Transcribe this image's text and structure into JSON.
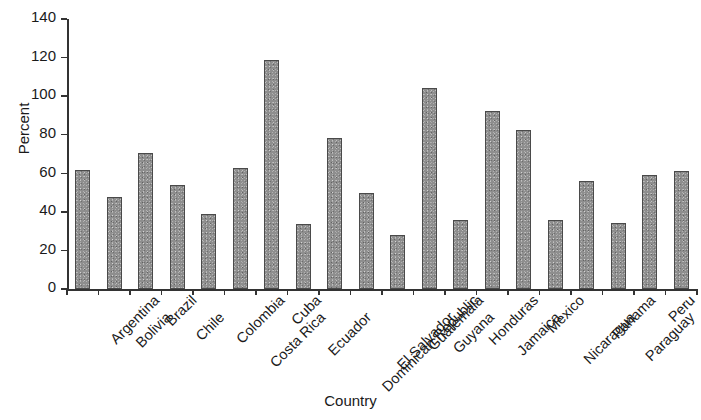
{
  "chart_data": {
    "type": "bar",
    "title": "",
    "xlabel": "Country",
    "ylabel": "Percent",
    "ylim": [
      0,
      140
    ],
    "yticks": [
      0,
      20,
      40,
      60,
      80,
      100,
      120,
      140
    ],
    "grid": false,
    "legend": null,
    "bar_color": "#8e8e8e",
    "bar_edge_color": "#4a4a4a",
    "categories": [
      "Argentina",
      "Bolivia",
      "Brazil",
      "Chile",
      "Colombia",
      "Costa Rica",
      "Cuba",
      "Ecuador",
      "Dominican Republic",
      "El Salvador",
      "Guatemala",
      "Guyana",
      "Honduras",
      "Jamaica",
      "Mexico",
      "Nicaragua",
      "Panama",
      "Paraguay",
      "Peru",
      "Uruguay"
    ],
    "values": [
      61.5,
      47.5,
      70.5,
      54,
      39,
      63,
      118.5,
      33.5,
      78.5,
      50,
      28,
      104,
      36,
      92.5,
      82.5,
      36,
      56,
      34,
      59,
      61
    ]
  }
}
